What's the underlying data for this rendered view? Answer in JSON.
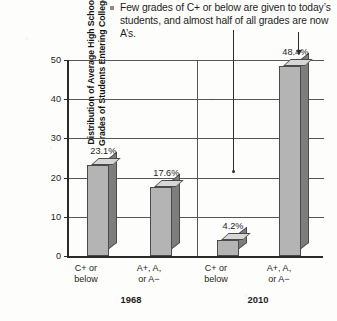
{
  "caption": {
    "bullet": "square-bullet",
    "text": "Few grades of C+ or below are given to today’s students, and almost half of all grades are now A’s."
  },
  "chart_data": {
    "type": "bar",
    "title": "",
    "xlabel": "",
    "ylabel": "Distribution of Average High School Grades of Students Entering College",
    "ylabel_line1": "Distribution of Average High School",
    "ylabel_line2": "Grades of Students Entering College",
    "ylim": [
      0,
      50
    ],
    "yticks": [
      0,
      10,
      20,
      30,
      40,
      50
    ],
    "ytick_labels": [
      "0",
      "10",
      "20",
      "30",
      "40",
      "50"
    ],
    "grid": "horizontal",
    "legend": "none",
    "groups": [
      "1968",
      "2010"
    ],
    "categories": [
      "C+ or below",
      "A+, A, or A−"
    ],
    "category_lines": [
      [
        "C+ or",
        "below"
      ],
      [
        "A+, A,",
        "or A−"
      ]
    ],
    "bars": [
      {
        "group": "1968",
        "category": "C+ or below",
        "value": 23.1,
        "label": "23.1%"
      },
      {
        "group": "1968",
        "category": "A+, A, or A−",
        "value": 17.6,
        "label": "17.6%"
      },
      {
        "group": "2010",
        "category": "C+ or below",
        "value": 4.2,
        "label": "4.2%"
      },
      {
        "group": "2010",
        "category": "A+, A, or A−",
        "value": 48.4,
        "label": "48.4%"
      }
    ],
    "annotations": [
      {
        "kind": "leader-line",
        "target": "4.2%"
      },
      {
        "kind": "leader-arrow",
        "target": "48.4%"
      }
    ],
    "colors": {
      "bar_front": "#b4b4b4",
      "bar_side": "#7d7d7d",
      "bar_top": "#d6d6d6",
      "outline": "#4a4a4a",
      "axis": "#2b2b2b",
      "grid": "#565656",
      "background": "#fdfdfb"
    }
  }
}
